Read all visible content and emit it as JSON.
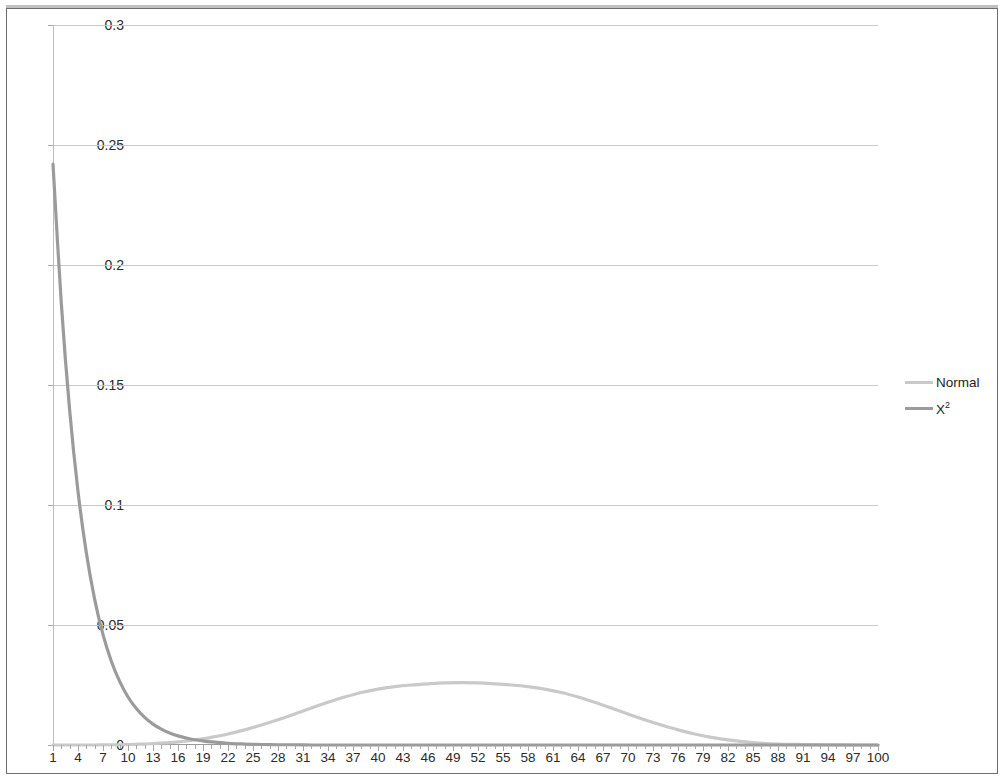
{
  "chart_data": {
    "type": "line",
    "title": "",
    "subtitle": "",
    "xlabel": "",
    "ylabel": "",
    "xlim": [
      1,
      100
    ],
    "ylim": [
      0,
      0.3
    ],
    "grid": true,
    "legend_position": "right",
    "y_ticks": [
      "0",
      "0.05",
      "0.1",
      "0.15",
      "0.2",
      "0.25",
      "0.3"
    ],
    "y_tick_values": [
      0,
      0.05,
      0.1,
      0.15,
      0.2,
      0.25,
      0.3
    ],
    "x_ticks": [
      "1",
      "4",
      "7",
      "10",
      "13",
      "16",
      "19",
      "22",
      "25",
      "28",
      "31",
      "34",
      "37",
      "40",
      "43",
      "46",
      "49",
      "52",
      "55",
      "58",
      "61",
      "64",
      "67",
      "70",
      "73",
      "76",
      "79",
      "82",
      "85",
      "88",
      "91",
      "94",
      "97",
      "100"
    ],
    "x_tick_values": [
      1,
      4,
      7,
      10,
      13,
      16,
      19,
      22,
      25,
      28,
      31,
      34,
      37,
      40,
      43,
      46,
      49,
      52,
      55,
      58,
      61,
      64,
      67,
      70,
      73,
      76,
      79,
      82,
      85,
      88,
      91,
      94,
      97,
      100
    ],
    "x": [
      1,
      2,
      3,
      4,
      5,
      6,
      7,
      8,
      9,
      10,
      11,
      12,
      13,
      14,
      15,
      16,
      17,
      18,
      19,
      20,
      22,
      24,
      26,
      28,
      30,
      32,
      34,
      36,
      38,
      40,
      42,
      44,
      46,
      48,
      50,
      52,
      54,
      56,
      58,
      60,
      62,
      64,
      66,
      68,
      70,
      72,
      74,
      76,
      78,
      80,
      82,
      85,
      88,
      91,
      94,
      97,
      100
    ],
    "series": [
      {
        "name": "Normal",
        "color": "#c9c9c9",
        "values": [
          0.0,
          0.0,
          0.0,
          0.0,
          0.0,
          0.0,
          0.0001,
          0.0001,
          0.0001,
          0.0002,
          0.0003,
          0.0004,
          0.0006,
          0.0008,
          0.001,
          0.0013,
          0.0017,
          0.0021,
          0.0026,
          0.0032,
          0.0046,
          0.0063,
          0.0083,
          0.0105,
          0.0129,
          0.0154,
          0.0178,
          0.02,
          0.0219,
          0.0233,
          0.0243,
          0.025,
          0.0255,
          0.0259,
          0.026,
          0.0259,
          0.0255,
          0.025,
          0.0243,
          0.0233,
          0.0219,
          0.02,
          0.0178,
          0.0154,
          0.0129,
          0.0105,
          0.0083,
          0.0063,
          0.0046,
          0.0032,
          0.0021,
          0.001,
          0.0004,
          0.0002,
          0.0001,
          0.0,
          0.0
        ]
      },
      {
        "name": "X²",
        "color": "#9b9b9b",
        "values": [
          0.242,
          0.1839,
          0.1394,
          0.1057,
          0.0801,
          0.0607,
          0.046,
          0.0349,
          0.0265,
          0.02,
          0.0152,
          0.0115,
          0.0087,
          0.0066,
          0.005,
          0.0038,
          0.0029,
          0.0022,
          0.0017,
          0.0013,
          0.0007,
          0.0004,
          0.0002,
          0.0001,
          0.0001,
          0.0,
          0.0,
          0.0,
          0.0,
          0.0,
          0.0,
          0.0,
          0.0,
          0.0,
          0.0,
          0.0,
          0.0,
          0.0,
          0.0,
          0.0,
          0.0,
          0.0,
          0.0,
          0.0,
          0.0,
          0.0,
          0.0,
          0.0,
          0.0,
          0.0,
          0.0,
          0.0,
          0.0,
          0.0,
          0.0,
          0.0,
          0.0
        ]
      }
    ],
    "annotations": []
  },
  "legend": {
    "entries": [
      {
        "label": "Normal",
        "superscript": "",
        "color": "#c9c9c9"
      },
      {
        "label": "X",
        "superscript": "2",
        "color": "#9b9b9b"
      }
    ]
  },
  "colors": {
    "gridline": "#c8c8c8",
    "axis": "#9a9a9a",
    "text": "#2b2b2b",
    "frame": "#6d6d6d",
    "background": "#ffffff"
  }
}
